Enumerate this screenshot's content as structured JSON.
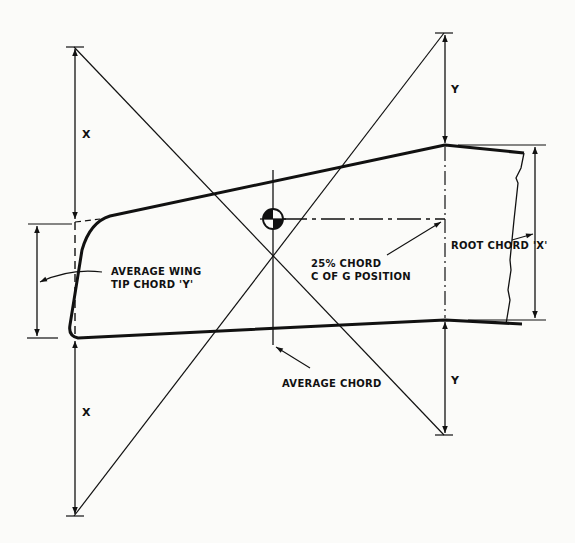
{
  "diagram": {
    "labels": {
      "tip_chord_line1": "AVERAGE WING",
      "tip_chord_line2": "TIP CHORD 'Y'",
      "cg_line1": "25% CHORD",
      "cg_line2": "C OF G POSITION",
      "root_chord": "ROOT CHORD 'X'",
      "average_chord": "AVERAGE CHORD"
    },
    "dimensions": {
      "left_upper": "X",
      "left_lower": "X",
      "right_upper": "Y",
      "right_lower": "Y"
    },
    "colors": {
      "ink": "#111111",
      "paper": "#fbfbf9"
    }
  }
}
